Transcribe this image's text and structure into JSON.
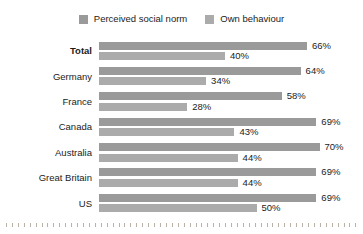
{
  "legend": {
    "entries": [
      {
        "label": "Perceived social norm",
        "color": "#9a9a9a",
        "swatch_icon": "square-swatch-icon"
      },
      {
        "label": "Own behaviour",
        "color": "#ababab",
        "swatch_icon": "square-swatch-icon"
      }
    ]
  },
  "colors": {
    "background": "#ffffff",
    "text": "#1b1b1b",
    "series_norm": "#9a9a9a",
    "series_own": "#ababab",
    "tick": "#b9b2a8"
  },
  "chart_data": {
    "type": "bar",
    "orientation": "horizontal",
    "title": "",
    "subtitle": "",
    "xlabel": "",
    "ylabel": "",
    "xlim": [
      0,
      80
    ],
    "grid": false,
    "legend_position": "top-center",
    "value_suffix": "%",
    "categories": [
      "Total",
      "Germany",
      "France",
      "Canada",
      "Australia",
      "Great Britain",
      "US"
    ],
    "emphasized_categories": [
      "Total"
    ],
    "series": [
      {
        "name": "Perceived social norm",
        "color": "#9a9a9a",
        "values": [
          66,
          64,
          58,
          69,
          70,
          69,
          69
        ],
        "labels": [
          "66%",
          "64%",
          "58%",
          "69%",
          "70%",
          "69%",
          "69%"
        ]
      },
      {
        "name": "Own behaviour",
        "color": "#ababab",
        "values": [
          40,
          34,
          28,
          43,
          44,
          44,
          50
        ],
        "labels": [
          "40%",
          "34%",
          "28%",
          "43%",
          "44%",
          "44%",
          "50%"
        ]
      }
    ]
  },
  "axis": {
    "baseline_tick_count": 60
  }
}
